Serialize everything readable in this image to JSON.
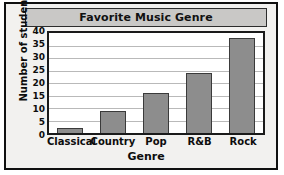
{
  "chart_data": {
    "type": "bar",
    "title": "Favorite Music Genre",
    "xlabel": "Genre",
    "ylabel": "Number of students",
    "categories": [
      "Classical",
      "Country",
      "Pop",
      "R&B",
      "Rock"
    ],
    "values": [
      2,
      9,
      16,
      24,
      38
    ],
    "ylim": [
      0,
      40
    ],
    "yticks": [
      0,
      5,
      10,
      15,
      20,
      25,
      30,
      35,
      40
    ],
    "ytick_labels": [
      "0",
      "5",
      "10",
      "15",
      "20",
      "25",
      "30",
      "35",
      "40"
    ],
    "grid": "horizontal",
    "legend": "none",
    "colors": {
      "bar_fill": "#8d8d8d",
      "bar_border": "#3a3a3a",
      "plot_background": "#ffffff",
      "figure_background": "#f2f1ef",
      "title_bar": "#c9c8c6",
      "gridline": "#b9b9b9",
      "axis": "#1a1a1a",
      "text": "#0d0d0d"
    }
  }
}
